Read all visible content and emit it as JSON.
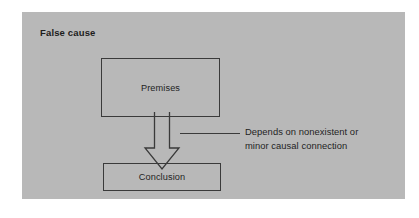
{
  "panel": {
    "title": "False cause",
    "background_color": "#b8b8b8",
    "stroke_color": "#3a3a3a",
    "text_color": "#1f1f1f"
  },
  "diagram": {
    "type": "flowchart",
    "nodes": [
      {
        "id": "premises",
        "label": "Premises"
      },
      {
        "id": "conclusion",
        "label": "Conclusion"
      }
    ],
    "connector": {
      "id": "premises-to-conclusion",
      "style": "hollow-block-arrow",
      "direction": "down",
      "from": "premises",
      "to": "conclusion"
    },
    "annotation": {
      "line_1": "Depends on nonexistent or",
      "line_2": "minor causal connection",
      "leader": "leader-line"
    }
  }
}
